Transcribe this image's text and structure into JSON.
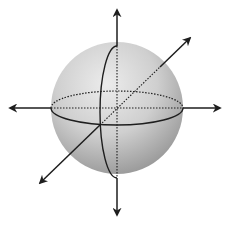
{
  "diagram": {
    "colors": {
      "background": "#ffffff",
      "sphere_light": "#e6e6e6",
      "sphere_dark": "#9e9e9e",
      "line": "#1e1e1e"
    },
    "sphere": {
      "cx": 117,
      "cy": 108,
      "r": 66
    },
    "axes": [
      {
        "name": "vertical-axis",
        "x1": 117,
        "y1": 215,
        "x2": 117,
        "y2": 10
      },
      {
        "name": "horizontal-axis",
        "x1": 10,
        "y1": 108,
        "x2": 220,
        "y2": 108
      },
      {
        "name": "depth-axis",
        "x1": 40,
        "y1": 183,
        "x2": 190,
        "y2": 38
      }
    ],
    "equator": {
      "rx": 66,
      "ry": 17
    },
    "meridian": {
      "rx": 17,
      "ry": 66
    }
  }
}
